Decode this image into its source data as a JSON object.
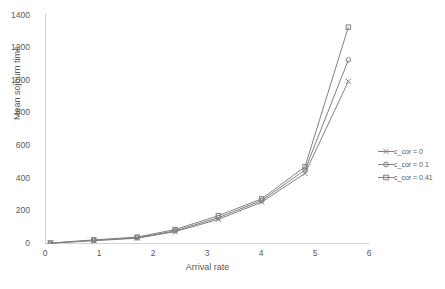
{
  "chart_data": {
    "type": "line",
    "title": "",
    "xlabel": "Arrival rate",
    "ylabel": "Mean sojourn time",
    "xlim": [
      0,
      6
    ],
    "ylim": [
      0,
      1400
    ],
    "xticks": [
      0,
      1,
      2,
      3,
      4,
      5,
      6
    ],
    "yticks": [
      0,
      200,
      400,
      600,
      800,
      1000,
      1200,
      1400
    ],
    "grid": false,
    "legend_position": "right",
    "x": [
      0.1,
      0.9,
      1.7,
      2.4,
      3.2,
      4.0,
      4.8,
      5.6
    ],
    "series": [
      {
        "name": "c_cor = 0",
        "color": "#808080",
        "values": [
          5,
          20,
          35,
          75,
          150,
          255,
          430,
          990
        ]
      },
      {
        "name": "c_cor = 0.1",
        "color": "#808080",
        "values": [
          5,
          22,
          38,
          80,
          160,
          265,
          450,
          1120
        ]
      },
      {
        "name": "c_cor = 0.41",
        "color": "#808080",
        "values": [
          6,
          25,
          42,
          88,
          172,
          275,
          470,
          1320
        ]
      }
    ]
  },
  "axis": {
    "xticks": [
      "0",
      "1",
      "2",
      "3",
      "4",
      "5",
      "6"
    ],
    "yticks": [
      "0",
      "200",
      "400",
      "600",
      "800",
      "1000",
      "1200",
      "1400"
    ],
    "xlabel": "Arrival rate",
    "ylabel": "Mean sojourn time"
  },
  "legend": {
    "items": [
      {
        "label": "c_cor = 0"
      },
      {
        "label": "c_cor = 0.1"
      },
      {
        "label": "c_cor = 0.41"
      }
    ]
  }
}
